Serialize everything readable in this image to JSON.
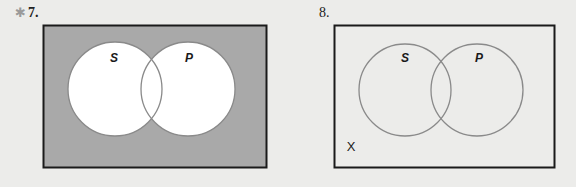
{
  "problems": [
    {
      "number": "7.",
      "marker": "✱",
      "universe_fill": "#a9a9a9",
      "circle_fill": "#ffffff",
      "circle_stroke": "#8a8a8a",
      "labels": {
        "left": "S",
        "right": "P"
      },
      "shaded_region": "outside both circles"
    },
    {
      "number": "8.",
      "universe_fill": "none",
      "circle_fill": "none",
      "circle_stroke": "#8a8a8a",
      "labels": {
        "left": "S",
        "right": "P",
        "outside_mark": "X"
      },
      "mark_region": "outside both circles"
    }
  ],
  "colors": {
    "background": "#ececea",
    "frame": "#1a1a1a"
  }
}
